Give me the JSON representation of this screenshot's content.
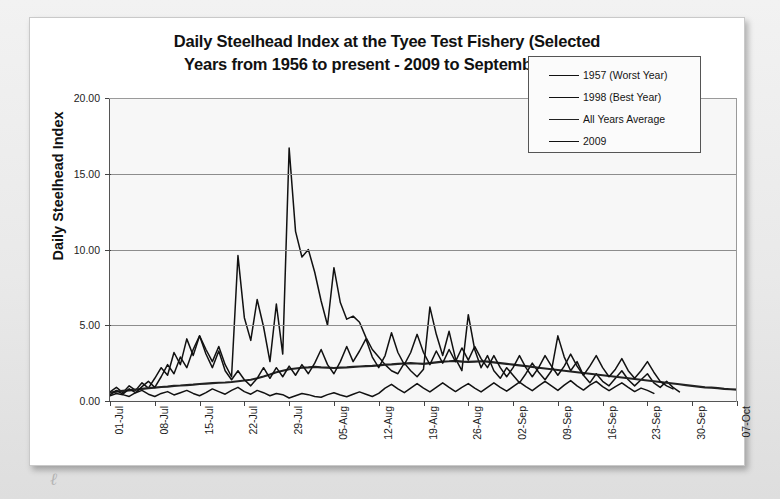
{
  "card": {
    "annotation_mark": "ℓ"
  },
  "chart_data": {
    "type": "line",
    "title": "Daily Steelhead Index at the Tyee Test Fishery (Selected Years from 1956 to present - 2009 to September 24th)",
    "title_line1": "Daily Steelhead Index at the Tyee Test Fishery (Selected",
    "title_line2": "Years from 1956 to present - 2009 to September 24th)",
    "xlabel": "",
    "ylabel": "Daily Steelhead Index",
    "ylim": [
      0,
      20
    ],
    "yticks": [
      "0.00",
      "5.00",
      "10.00",
      "15.00",
      "20.00"
    ],
    "ytick_values": [
      0,
      5,
      10,
      15,
      20
    ],
    "grid": true,
    "legend_position": "top-right",
    "xtick_labels": [
      "01-Jul",
      "08-Jul",
      "15-Jul",
      "22-Jul",
      "29-Jul",
      "05-Aug",
      "12-Aug",
      "19-Aug",
      "26-Aug",
      "02-Sep",
      "09-Sep",
      "16-Sep",
      "23-Sep",
      "30-Sep",
      "07-Oct"
    ],
    "xtick_indices": [
      0,
      7,
      14,
      21,
      28,
      35,
      42,
      49,
      56,
      63,
      70,
      77,
      84,
      91,
      98
    ],
    "x_start": "01-Jul",
    "x_end": "07-Oct",
    "n_days": 99,
    "series": [
      {
        "name": "1957 (Worst Year)",
        "color": "#111111",
        "values": [
          0.35,
          0.5,
          0.42,
          0.3,
          0.55,
          0.7,
          0.45,
          0.3,
          0.5,
          0.62,
          0.4,
          0.55,
          0.7,
          0.5,
          0.35,
          0.55,
          0.8,
          0.62,
          0.45,
          0.7,
          0.9,
          0.62,
          0.45,
          0.7,
          0.55,
          0.35,
          0.5,
          0.42,
          0.2,
          0.35,
          0.5,
          0.42,
          0.3,
          0.25,
          0.42,
          0.55,
          0.4,
          0.28,
          0.45,
          0.6,
          0.45,
          0.3,
          0.5,
          0.85,
          1.1,
          0.8,
          0.55,
          0.85,
          1.15,
          0.85,
          0.6,
          0.9,
          1.2,
          0.9,
          0.62,
          0.9,
          1.15,
          0.85,
          0.6,
          0.9,
          1.2,
          0.9,
          0.65,
          0.95,
          1.25,
          0.95,
          0.68,
          1.0,
          1.3,
          1.0,
          0.7,
          1.05,
          1.35,
          1.0,
          0.72,
          1.05,
          1.3,
          0.95,
          0.68,
          0.95,
          1.2,
          0.9,
          0.62,
          0.85,
          0.7,
          0.5,
          0,
          0,
          0,
          0,
          0,
          0,
          0,
          0,
          0,
          0,
          0,
          0,
          0
        ]
      },
      {
        "name": "1998 (Best Year)",
        "color": "#111111",
        "values": [
          0.6,
          0.9,
          0.55,
          1.0,
          0.7,
          1.2,
          0.85,
          1.5,
          2.2,
          1.7,
          3.2,
          2.4,
          4.1,
          3.0,
          4.3,
          3.4,
          2.6,
          3.6,
          2.4,
          1.6,
          9.6,
          5.5,
          4.0,
          6.7,
          4.9,
          2.6,
          6.4,
          3.1,
          16.7,
          11.2,
          9.5,
          10.0,
          8.5,
          6.6,
          5.0,
          8.8,
          6.5,
          5.4,
          5.6,
          5.2,
          4.2,
          3.4,
          2.9,
          2.4,
          2.0,
          1.8,
          2.5,
          2.0,
          1.6,
          2.1,
          6.2,
          4.4,
          3.0,
          4.6,
          2.8,
          2.0,
          5.7,
          3.4,
          2.2,
          3.0,
          2.0,
          1.5,
          2.2,
          1.7,
          1.2,
          1.8,
          2.5,
          1.9,
          1.4,
          2.0,
          4.3,
          2.9,
          2.0,
          2.6,
          1.7,
          1.2,
          1.8,
          1.3,
          1.0,
          1.5,
          2.0,
          1.4,
          1.0,
          1.4,
          1.8,
          1.2,
          0.9,
          1.3,
          0.9,
          0.6,
          0,
          0,
          0,
          0,
          0,
          0,
          0,
          0,
          0
        ]
      },
      {
        "name": "All Years Average",
        "color": "#222222",
        "values": [
          0.55,
          0.62,
          0.68,
          0.7,
          0.75,
          0.8,
          0.85,
          0.88,
          0.92,
          0.95,
          1.0,
          1.02,
          1.05,
          1.08,
          1.12,
          1.15,
          1.18,
          1.2,
          1.22,
          1.25,
          1.3,
          1.35,
          1.4,
          1.5,
          1.62,
          1.75,
          1.9,
          2.0,
          2.1,
          2.15,
          2.2,
          2.22,
          2.25,
          2.22,
          2.2,
          2.18,
          2.2,
          2.22,
          2.25,
          2.28,
          2.3,
          2.32,
          2.35,
          2.4,
          2.42,
          2.45,
          2.48,
          2.5,
          2.48,
          2.45,
          2.5,
          2.55,
          2.6,
          2.62,
          2.65,
          2.6,
          2.58,
          2.6,
          2.62,
          2.6,
          2.55,
          2.5,
          2.45,
          2.4,
          2.35,
          2.3,
          2.25,
          2.2,
          2.15,
          2.1,
          2.05,
          2.0,
          1.95,
          1.9,
          1.85,
          1.8,
          1.75,
          1.7,
          1.65,
          1.6,
          1.55,
          1.5,
          1.45,
          1.4,
          1.35,
          1.3,
          1.25,
          1.2,
          1.15,
          1.1,
          1.05,
          1.0,
          0.95,
          0.9,
          0.88,
          0.85,
          0.8,
          0.78,
          0.75
        ]
      },
      {
        "name": "2009",
        "color": "#111111",
        "values": [
          0.4,
          0.7,
          0.45,
          0.8,
          0.55,
          0.95,
          1.3,
          0.9,
          1.6,
          2.4,
          1.8,
          2.9,
          2.2,
          3.4,
          4.3,
          3.1,
          2.2,
          3.3,
          2.0,
          1.4,
          2.0,
          1.4,
          1.0,
          1.5,
          2.2,
          1.5,
          2.2,
          1.6,
          2.3,
          1.7,
          2.4,
          1.8,
          2.5,
          3.4,
          2.4,
          1.8,
          2.6,
          3.6,
          2.6,
          3.3,
          4.1,
          2.9,
          2.2,
          3.0,
          4.5,
          3.2,
          2.4,
          3.2,
          4.4,
          3.2,
          2.4,
          3.3,
          2.5,
          3.4,
          2.6,
          3.5,
          2.7,
          3.6,
          2.8,
          2.2,
          3.0,
          2.2,
          1.6,
          2.2,
          3.0,
          2.2,
          1.6,
          2.2,
          3.0,
          2.3,
          1.7,
          2.3,
          3.1,
          2.3,
          1.7,
          2.3,
          3.0,
          2.2,
          1.6,
          2.1,
          2.8,
          2.0,
          1.5,
          2.0,
          2.6,
          1.9,
          1.3,
          1.0,
          0.8,
          0,
          0,
          0,
          0,
          0,
          0,
          0,
          0,
          0,
          0
        ]
      }
    ]
  }
}
